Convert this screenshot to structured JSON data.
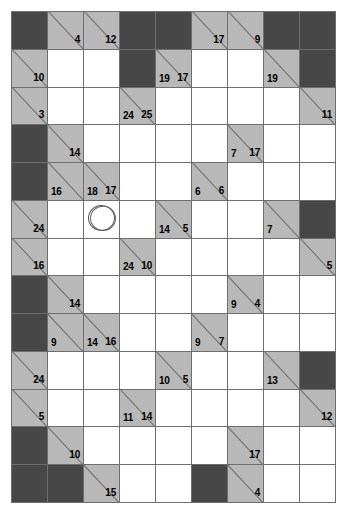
{
  "puzzle": {
    "name": "kakuro-grid",
    "columns": 9,
    "rows": 13,
    "colors": {
      "block": "#474747",
      "clue": "#b8b8b8",
      "open": "#ffffff",
      "grid_line": "#6e6e6e",
      "number": "#000000"
    },
    "legend": {
      "block_label": "blocked-cell",
      "clue_label": "clue-cell",
      "open_label": "open-cell",
      "across_label": "across-sum",
      "down_label": "down-sum",
      "circle_label": "hand-drawn-circle-mark"
    },
    "cells": [
      [
        {
          "t": "block"
        },
        {
          "t": "clue",
          "across": "4"
        },
        {
          "t": "clue",
          "across": "12"
        },
        {
          "t": "block"
        },
        {
          "t": "block"
        },
        {
          "t": "clue",
          "across": "17"
        },
        {
          "t": "clue",
          "across": "9"
        },
        {
          "t": "block"
        },
        {
          "t": "block"
        }
      ],
      [
        {
          "t": "clue",
          "across": "10"
        },
        {
          "t": "open"
        },
        {
          "t": "open"
        },
        {
          "t": "block"
        },
        {
          "t": "clue",
          "across": "17",
          "down": "19"
        },
        {
          "t": "open"
        },
        {
          "t": "open"
        },
        {
          "t": "clue",
          "down": "19"
        },
        {
          "t": "block"
        }
      ],
      [
        {
          "t": "clue",
          "across": "3"
        },
        {
          "t": "open"
        },
        {
          "t": "open"
        },
        {
          "t": "clue",
          "across": "25",
          "down": "24"
        },
        {
          "t": "open"
        },
        {
          "t": "open"
        },
        {
          "t": "open"
        },
        {
          "t": "open"
        },
        {
          "t": "clue",
          "across": "11"
        }
      ],
      [
        {
          "t": "block"
        },
        {
          "t": "clue",
          "across": "14"
        },
        {
          "t": "open"
        },
        {
          "t": "open"
        },
        {
          "t": "open"
        },
        {
          "t": "open"
        },
        {
          "t": "clue",
          "across": "17",
          "down": "7"
        },
        {
          "t": "open"
        },
        {
          "t": "open"
        }
      ],
      [
        {
          "t": "block"
        },
        {
          "t": "clue",
          "down": "16"
        },
        {
          "t": "clue",
          "across": "17",
          "down": "18"
        },
        {
          "t": "open"
        },
        {
          "t": "open"
        },
        {
          "t": "clue",
          "across": "6",
          "down": "6"
        },
        {
          "t": "open"
        },
        {
          "t": "open"
        },
        {
          "t": "open"
        }
      ],
      [
        {
          "t": "clue",
          "across": "24"
        },
        {
          "t": "open"
        },
        {
          "t": "open",
          "circle": true
        },
        {
          "t": "open"
        },
        {
          "t": "clue",
          "across": "5",
          "down": "14"
        },
        {
          "t": "open"
        },
        {
          "t": "open"
        },
        {
          "t": "clue",
          "down": "7"
        },
        {
          "t": "block"
        }
      ],
      [
        {
          "t": "clue",
          "across": "16"
        },
        {
          "t": "open"
        },
        {
          "t": "open"
        },
        {
          "t": "clue",
          "across": "10",
          "down": "24"
        },
        {
          "t": "open"
        },
        {
          "t": "open"
        },
        {
          "t": "open"
        },
        {
          "t": "open"
        },
        {
          "t": "clue",
          "across": "5"
        }
      ],
      [
        {
          "t": "block"
        },
        {
          "t": "clue",
          "across": "14"
        },
        {
          "t": "open"
        },
        {
          "t": "open"
        },
        {
          "t": "open"
        },
        {
          "t": "open"
        },
        {
          "t": "clue",
          "across": "4",
          "down": "9"
        },
        {
          "t": "open"
        },
        {
          "t": "open"
        }
      ],
      [
        {
          "t": "block"
        },
        {
          "t": "clue",
          "down": "9"
        },
        {
          "t": "clue",
          "across": "16",
          "down": "14"
        },
        {
          "t": "open"
        },
        {
          "t": "open"
        },
        {
          "t": "clue",
          "across": "7",
          "down": "9"
        },
        {
          "t": "open"
        },
        {
          "t": "open"
        },
        {
          "t": "open"
        }
      ],
      [
        {
          "t": "clue",
          "across": "24"
        },
        {
          "t": "open"
        },
        {
          "t": "open"
        },
        {
          "t": "open"
        },
        {
          "t": "clue",
          "across": "5",
          "down": "10"
        },
        {
          "t": "open"
        },
        {
          "t": "open"
        },
        {
          "t": "clue",
          "down": "13"
        },
        {
          "t": "block"
        }
      ],
      [
        {
          "t": "clue",
          "across": "5"
        },
        {
          "t": "open"
        },
        {
          "t": "open"
        },
        {
          "t": "clue",
          "across": "14",
          "down": "11"
        },
        {
          "t": "open"
        },
        {
          "t": "open"
        },
        {
          "t": "open"
        },
        {
          "t": "open"
        },
        {
          "t": "clue",
          "across": "12"
        }
      ],
      [
        {
          "t": "block"
        },
        {
          "t": "clue",
          "across": "10"
        },
        {
          "t": "open"
        },
        {
          "t": "open"
        },
        {
          "t": "open"
        },
        {
          "t": "open"
        },
        {
          "t": "clue",
          "across": "17"
        },
        {
          "t": "open"
        },
        {
          "t": "open"
        }
      ],
      [
        {
          "t": "block"
        },
        {
          "t": "block"
        },
        {
          "t": "clue",
          "across": "15"
        },
        {
          "t": "open"
        },
        {
          "t": "open"
        },
        {
          "t": "block"
        },
        {
          "t": "clue",
          "across": "4"
        },
        {
          "t": "open"
        },
        {
          "t": "open"
        }
      ]
    ]
  }
}
